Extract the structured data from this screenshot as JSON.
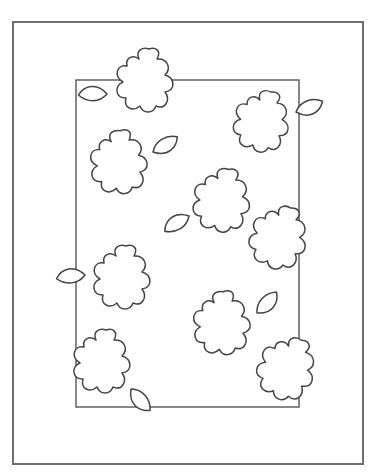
{
  "page": {
    "background": "#ffffff",
    "line_color": "#444444"
  },
  "frames": {
    "outer": {
      "x": 13,
      "y": 22,
      "width": 350,
      "height": 442,
      "stroke": "#6e6e6e"
    },
    "inner": {
      "x": 76,
      "y": 80,
      "width": 223,
      "height": 327,
      "stroke": "#555555"
    }
  },
  "flowers": [
    {
      "id": 1,
      "cx": 145,
      "cy": 80,
      "scale": 1.0,
      "rotate": 0,
      "leaf": {
        "side": "left",
        "x": 107,
        "y": 94,
        "rotate": 190
      }
    },
    {
      "id": 2,
      "cx": 262,
      "cy": 121,
      "scale": 0.97,
      "rotate": 10,
      "leaf": {
        "side": "right",
        "x": 296,
        "y": 112,
        "rotate": -10
      }
    },
    {
      "id": 3,
      "cx": 119,
      "cy": 162,
      "scale": 1.0,
      "rotate": -5,
      "leaf": {
        "side": "right",
        "x": 153,
        "y": 152,
        "rotate": -20
      }
    },
    {
      "id": 4,
      "cx": 222,
      "cy": 200,
      "scale": 1.0,
      "rotate": 5,
      "leaf": {
        "side": "bottom-left",
        "x": 189,
        "y": 216,
        "rotate": 160
      }
    },
    {
      "id": 5,
      "cx": 279,
      "cy": 237,
      "scale": 1.0,
      "rotate": 15,
      "leaf": null
    },
    {
      "id": 6,
      "cx": 122,
      "cy": 277,
      "scale": 1.0,
      "rotate": 0,
      "leaf": {
        "side": "left",
        "x": 85,
        "y": 275,
        "rotate": 185
      }
    },
    {
      "id": 7,
      "cx": 222,
      "cy": 323,
      "scale": 1.0,
      "rotate": -5,
      "leaf": {
        "side": "right",
        "x": 257,
        "y": 313,
        "rotate": -35
      }
    },
    {
      "id": 8,
      "cx": 287,
      "cy": 368,
      "scale": 1.0,
      "rotate": 20,
      "leaf": null
    },
    {
      "id": 9,
      "cx": 102,
      "cy": 361,
      "scale": 1.0,
      "rotate": 0,
      "leaf": {
        "side": "bottom-right",
        "x": 131,
        "y": 389,
        "rotate": 60
      }
    }
  ]
}
